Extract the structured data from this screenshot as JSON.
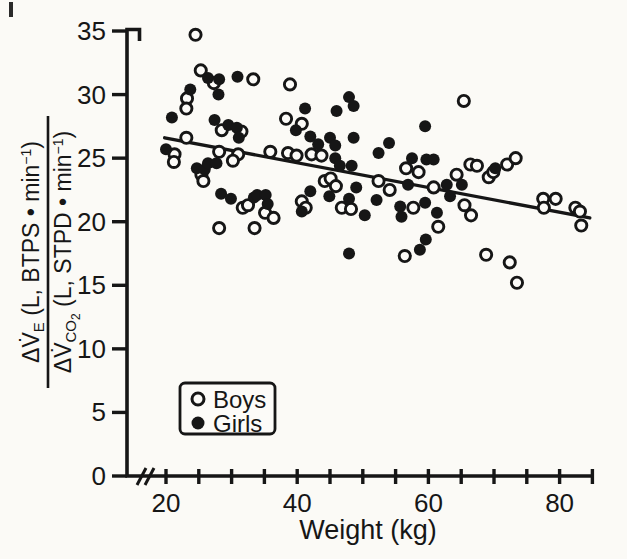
{
  "page": {
    "paper": "#fbfaf6",
    "ink": "#161616",
    "marker_fill_open": "#fcfbf8"
  },
  "chart_data": {
    "type": "scatter",
    "title": "",
    "xlabel": "Weight (kg)",
    "ylabel": {
      "numerator": [
        {
          "t": "ΔV̇"
        },
        {
          "t": "E",
          "v": "sub"
        },
        {
          "t": " (L, BTPS "
        },
        {
          "t": "•"
        },
        {
          "t": " min"
        },
        {
          "t": "−1",
          "v": "sup"
        },
        {
          "t": ")"
        }
      ],
      "denominator": [
        {
          "t": "ΔV̇"
        },
        {
          "t": "CO",
          "v": "sub"
        },
        {
          "t": "2",
          "v": "sub2"
        },
        {
          "t": " (L, STPD "
        },
        {
          "t": "•"
        },
        {
          "t": " min"
        },
        {
          "t": "−1",
          "v": "sup"
        },
        {
          "t": ")"
        }
      ]
    },
    "x_axis": {
      "min": 20,
      "max": 85,
      "tick_step": 5,
      "labeled_ticks": [
        20,
        40,
        60,
        80
      ],
      "break_before_min": true
    },
    "y_axis": {
      "min": 0,
      "max": 35,
      "ticks": [
        0,
        5,
        10,
        15,
        20,
        25,
        30,
        35
      ]
    },
    "grid": false,
    "legend_position": "lower-left",
    "legend": [
      {
        "label": "Boys",
        "marker": "open"
      },
      {
        "label": "Girls",
        "marker": "filled"
      }
    ],
    "regression_line": {
      "from": [
        19.8,
        26.6
      ],
      "to": [
        84.6,
        20.3
      ]
    },
    "series": [
      {
        "name": "Boys",
        "marker": "open",
        "points": [
          [
            24.5,
            34.7
          ],
          [
            25.3,
            31.9
          ],
          [
            27.3,
            30.9
          ],
          [
            33.3,
            31.2
          ],
          [
            38.9,
            30.8
          ],
          [
            23.2,
            29.7
          ],
          [
            23.1,
            28.9
          ],
          [
            65.4,
            29.5
          ],
          [
            38.3,
            28.1
          ],
          [
            40.7,
            27.7
          ],
          [
            28.5,
            27.2
          ],
          [
            31.5,
            27.1
          ],
          [
            23.1,
            26.6
          ],
          [
            21.3,
            25.3
          ],
          [
            21.2,
            24.7
          ],
          [
            28.1,
            25.5
          ],
          [
            31.0,
            25.3
          ],
          [
            30.2,
            24.8
          ],
          [
            35.9,
            25.5
          ],
          [
            38.6,
            25.4
          ],
          [
            39.9,
            25.2
          ],
          [
            42.2,
            25.3
          ],
          [
            43.7,
            25.2
          ],
          [
            25.4,
            23.7
          ],
          [
            25.7,
            23.2
          ],
          [
            44.2,
            23.2
          ],
          [
            45.1,
            23.4
          ],
          [
            45.9,
            22.8
          ],
          [
            46.8,
            21.1
          ],
          [
            48.2,
            21.0
          ],
          [
            52.4,
            23.2
          ],
          [
            54.1,
            22.5
          ],
          [
            56.6,
            24.2
          ],
          [
            58.5,
            23.9
          ],
          [
            60.8,
            22.7
          ],
          [
            57.7,
            21.1
          ],
          [
            61.5,
            19.6
          ],
          [
            64.3,
            23.7
          ],
          [
            65.5,
            21.3
          ],
          [
            66.5,
            20.5
          ],
          [
            66.4,
            24.5
          ],
          [
            67.4,
            24.4
          ],
          [
            72.0,
            24.5
          ],
          [
            73.3,
            25.0
          ],
          [
            69.2,
            23.5
          ],
          [
            69.9,
            23.9
          ],
          [
            77.5,
            21.8
          ],
          [
            77.6,
            21.1
          ],
          [
            79.4,
            21.8
          ],
          [
            82.4,
            21.1
          ],
          [
            83.1,
            20.8
          ],
          [
            83.3,
            19.7
          ],
          [
            68.8,
            17.4
          ],
          [
            72.4,
            16.8
          ],
          [
            73.5,
            15.2
          ],
          [
            56.4,
            17.3
          ],
          [
            28.1,
            19.5
          ],
          [
            33.5,
            19.5
          ],
          [
            31.7,
            21.1
          ],
          [
            32.5,
            21.3
          ],
          [
            35.1,
            20.7
          ],
          [
            36.4,
            20.3
          ],
          [
            40.7,
            21.6
          ],
          [
            41.3,
            21.1
          ]
        ]
      },
      {
        "name": "Girls",
        "marker": "filled",
        "points": [
          [
            26.4,
            31.3
          ],
          [
            28.1,
            31.2
          ],
          [
            30.9,
            31.4
          ],
          [
            23.7,
            30.4
          ],
          [
            28.0,
            30.0
          ],
          [
            20.9,
            28.2
          ],
          [
            41.2,
            28.9
          ],
          [
            39.8,
            27.2
          ],
          [
            27.4,
            28.0
          ],
          [
            29.5,
            27.6
          ],
          [
            30.8,
            27.4
          ],
          [
            31.1,
            26.6
          ],
          [
            46.0,
            28.7
          ],
          [
            47.9,
            29.8
          ],
          [
            48.6,
            29.1
          ],
          [
            42.0,
            26.7
          ],
          [
            43.2,
            26.1
          ],
          [
            45.0,
            26.6
          ],
          [
            45.8,
            26.0
          ],
          [
            48.6,
            26.6
          ],
          [
            45.8,
            25.0
          ],
          [
            46.5,
            24.4
          ],
          [
            48.3,
            24.4
          ],
          [
            52.4,
            25.4
          ],
          [
            54.0,
            26.2
          ],
          [
            57.5,
            25.0
          ],
          [
            59.7,
            24.9
          ],
          [
            60.8,
            24.9
          ],
          [
            59.5,
            27.5
          ],
          [
            65.1,
            22.9
          ],
          [
            20.0,
            25.7
          ],
          [
            24.7,
            24.2
          ],
          [
            25.9,
            24.1
          ],
          [
            26.4,
            24.6
          ],
          [
            27.7,
            24.6
          ],
          [
            28.4,
            22.2
          ],
          [
            29.9,
            21.8
          ],
          [
            33.4,
            21.9
          ],
          [
            33.9,
            22.1
          ],
          [
            35.2,
            22.1
          ],
          [
            35.5,
            21.4
          ],
          [
            40.7,
            20.8
          ],
          [
            42.0,
            22.4
          ],
          [
            44.9,
            22.0
          ],
          [
            47.9,
            21.8
          ],
          [
            49.0,
            22.7
          ],
          [
            52.1,
            21.7
          ],
          [
            50.3,
            20.5
          ],
          [
            55.7,
            21.2
          ],
          [
            55.9,
            20.4
          ],
          [
            56.9,
            22.9
          ],
          [
            59.5,
            21.5
          ],
          [
            61.3,
            20.7
          ],
          [
            62.8,
            22.9
          ],
          [
            63.3,
            22.0
          ],
          [
            47.9,
            17.5
          ],
          [
            58.7,
            17.8
          ],
          [
            59.6,
            18.6
          ],
          [
            70.2,
            24.2
          ]
        ]
      }
    ]
  }
}
